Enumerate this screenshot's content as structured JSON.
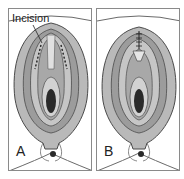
{
  "figure": {
    "panels": [
      {
        "id": "A",
        "label": "A",
        "callout": "Incision",
        "shows": "incision-lines"
      },
      {
        "id": "B",
        "label": "B",
        "shows": "sutures"
      }
    ]
  },
  "colors": {
    "border": "#8a8a8a",
    "outer_tissue": "#b9b9b9",
    "mid_tissue": "#9c9c9c",
    "inner_tissue": "#d2d2d2",
    "dark_center": "#2a2a2a",
    "outline": "#4a4a4a"
  }
}
